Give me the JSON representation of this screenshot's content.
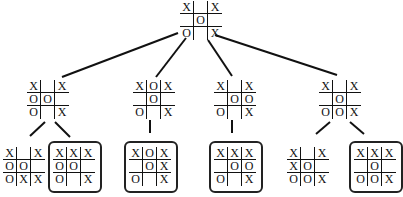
{
  "line_color": "#111111",
  "nodes": [
    {
      "id": "root",
      "x": 180,
      "y": 1,
      "boxed": false,
      "cells": [
        "X",
        "",
        "X",
        "",
        "O",
        "",
        "O",
        "",
        "X"
      ]
    },
    {
      "id": "n1",
      "x": 27,
      "y": 80,
      "boxed": false,
      "cells": [
        "X",
        "",
        "X",
        "O",
        "O",
        "",
        "O",
        "",
        "X"
      ]
    },
    {
      "id": "n2",
      "x": 133,
      "y": 80,
      "boxed": false,
      "cells": [
        "X",
        "O",
        "X",
        "",
        "O",
        "",
        "O",
        "",
        "X"
      ]
    },
    {
      "id": "n3",
      "x": 214,
      "y": 80,
      "boxed": false,
      "cells": [
        "X",
        "",
        "X",
        "",
        "O",
        "O",
        "O",
        "",
        "X"
      ]
    },
    {
      "id": "n4",
      "x": 319,
      "y": 80,
      "boxed": false,
      "cells": [
        "X",
        "",
        "X",
        "",
        "O",
        "",
        "O",
        "O",
        "X"
      ]
    },
    {
      "id": "l1",
      "x": 3,
      "y": 147,
      "boxed": false,
      "cells": [
        "X",
        "",
        "X",
        "O",
        "O",
        "",
        "O",
        "X",
        "X"
      ]
    },
    {
      "id": "l2",
      "x": 53,
      "y": 147,
      "boxed": true,
      "cells": [
        "X",
        "X",
        "X",
        "O",
        "O",
        "",
        "O",
        "",
        "X"
      ]
    },
    {
      "id": "l3",
      "x": 129,
      "y": 147,
      "boxed": true,
      "cells": [
        "X",
        "O",
        "X",
        "",
        "O",
        "X",
        "O",
        "",
        "X"
      ]
    },
    {
      "id": "l4",
      "x": 214,
      "y": 147,
      "boxed": true,
      "cells": [
        "X",
        "X",
        "X",
        "",
        "O",
        "O",
        "O",
        "",
        "X"
      ]
    },
    {
      "id": "l5",
      "x": 287,
      "y": 147,
      "boxed": false,
      "cells": [
        "X",
        "",
        "X",
        "X",
        "O",
        "",
        "O",
        "O",
        "X"
      ]
    },
    {
      "id": "l6",
      "x": 354,
      "y": 147,
      "boxed": true,
      "cells": [
        "X",
        "X",
        "X",
        "",
        "O",
        "",
        "O",
        "O",
        "X"
      ]
    }
  ],
  "edges": [
    [
      178,
      33,
      62,
      77
    ],
    [
      186,
      38,
      156,
      77
    ],
    [
      208,
      40,
      232,
      76
    ],
    [
      215,
      35,
      337,
      75
    ],
    [
      45,
      122,
      30,
      136
    ],
    [
      55,
      122,
      70,
      137
    ],
    [
      150,
      120,
      150,
      133
    ],
    [
      232,
      120,
      232,
      133
    ],
    [
      330,
      122,
      316,
      134
    ],
    [
      350,
      122,
      364,
      134
    ]
  ]
}
